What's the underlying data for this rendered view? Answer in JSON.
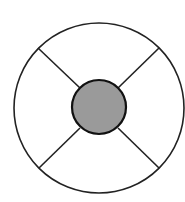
{
  "diagram": {
    "type": "ring-with-hub",
    "outer_circle": {
      "cx": 99,
      "cy": 108,
      "r": 85,
      "stroke": "#222222",
      "fill": "#ffffff"
    },
    "inner_circle": {
      "cx": 99,
      "cy": 107,
      "r": 27,
      "stroke": "#111111",
      "fill": "#9a9a9a"
    },
    "spokes": [
      {
        "x1": 38,
        "y1": 48,
        "x2": 80,
        "y2": 88
      },
      {
        "x1": 159,
        "y1": 48,
        "x2": 118,
        "y2": 88
      },
      {
        "x1": 39,
        "y1": 168,
        "x2": 80,
        "y2": 128
      },
      {
        "x1": 159,
        "y1": 168,
        "x2": 118,
        "y2": 128
      }
    ],
    "colors": {
      "line": "#222222",
      "hub_fill": "#9a9a9a",
      "background": "#ffffff"
    }
  }
}
